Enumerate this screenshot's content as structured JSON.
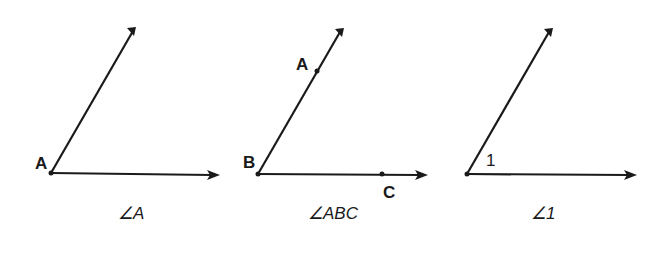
{
  "figures": [
    {
      "id": "angle-a",
      "vertex_label": "A",
      "caption": "∠A"
    },
    {
      "id": "angle-abc",
      "vertex_label": "B",
      "point_on_upper_ray": "A",
      "point_on_lower_ray": "C",
      "caption": "∠ABC"
    },
    {
      "id": "angle-1",
      "interior_label": "1",
      "caption": "∠1"
    }
  ],
  "colors": {
    "ink": "#1a1a1a",
    "background": "#ffffff"
  }
}
